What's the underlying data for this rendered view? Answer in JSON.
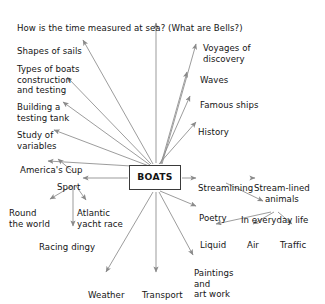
{
  "diagram": {
    "type": "mind-map",
    "title_question": "How is the time measured at sea? (What are Bells?)",
    "center": {
      "id": "boats",
      "label": "BOATS",
      "x": 129,
      "y": 165,
      "w": 52,
      "h": 25
    },
    "colors": {
      "background": "#ffffff",
      "text": "#141414",
      "edge": "#8c8c8c",
      "box_border": "#3a3a3a"
    },
    "nodes": [
      {
        "id": "time-at-sea",
        "label": "How is the time measured at sea? (What are Bells?)",
        "x": 17,
        "y": 13,
        "align": "left"
      },
      {
        "id": "shapes-of-sails",
        "label": "Shapes of sails",
        "x": 17,
        "y": 36,
        "align": "left"
      },
      {
        "id": "types-of-boats",
        "label": "Types of boats\nconstruction\nand testing",
        "x": 17,
        "y": 54,
        "align": "left"
      },
      {
        "id": "building-tank",
        "label": "Building a\ntesting tank",
        "x": 17,
        "y": 92,
        "align": "left"
      },
      {
        "id": "study-of-variables",
        "label": "Study of\nvariables",
        "x": 17,
        "y": 120,
        "align": "left"
      },
      {
        "id": "americas-cup",
        "label": "America's Cup",
        "x": 20,
        "y": 155,
        "align": "left"
      },
      {
        "id": "sport",
        "label": "Sport",
        "x": 57,
        "y": 172,
        "align": "left"
      },
      {
        "id": "round-the-world",
        "label": "Round\nthe world",
        "x": 9,
        "y": 198,
        "align": "left"
      },
      {
        "id": "atlantic-yacht-race",
        "label": "Atlantic\nyacht race",
        "x": 77,
        "y": 198,
        "align": "left"
      },
      {
        "id": "racing-dingy",
        "label": "Racing dingy",
        "x": 39,
        "y": 232,
        "align": "left"
      },
      {
        "id": "weather",
        "label": "Weather",
        "x": 88,
        "y": 280,
        "align": "left"
      },
      {
        "id": "transport",
        "label": "Transport",
        "x": 142,
        "y": 280,
        "align": "left"
      },
      {
        "id": "paintings-art-work",
        "label": "Paintings\nand\nart work",
        "x": 194,
        "y": 258,
        "align": "left"
      },
      {
        "id": "poetry",
        "label": "Poetry",
        "x": 199,
        "y": 203,
        "align": "left"
      },
      {
        "id": "streamlining",
        "label": "Streamlining",
        "x": 198,
        "y": 173,
        "align": "left"
      },
      {
        "id": "stream-lined-animals",
        "label": "Stream-lined\nanimals",
        "x": 256,
        "y": 173,
        "align": "left"
      },
      {
        "id": "in-everyday-life",
        "label": "In everyday life",
        "x": 241,
        "y": 205,
        "align": "left"
      },
      {
        "id": "liquid",
        "label": "Liquid",
        "x": 200,
        "y": 230,
        "align": "left"
      },
      {
        "id": "air",
        "label": "Air",
        "x": 247,
        "y": 230,
        "align": "left"
      },
      {
        "id": "traffic",
        "label": "Traffic",
        "x": 280,
        "y": 230,
        "align": "left"
      },
      {
        "id": "history",
        "label": "History",
        "x": 198,
        "y": 117,
        "align": "left"
      },
      {
        "id": "famous-ships",
        "label": "Famous ships",
        "x": 200,
        "y": 90,
        "align": "left"
      },
      {
        "id": "waves",
        "label": "Waves",
        "x": 200,
        "y": 65,
        "align": "left"
      },
      {
        "id": "voyages-of-discovery",
        "label": "Voyages of\ndiscovery",
        "x": 203,
        "y": 33,
        "align": "left"
      }
    ],
    "edges": [
      {
        "from": "boats",
        "to": "time-at-sea",
        "x1": 156,
        "y1": 163,
        "x2": 156,
        "y2": 23
      },
      {
        "from": "boats",
        "to": "shapes-of-sails",
        "x1": 153,
        "y1": 164,
        "x2": 83,
        "y2": 40
      },
      {
        "from": "boats",
        "to": "types-of-boats",
        "x1": 151,
        "y1": 164,
        "x2": 67,
        "y2": 77
      },
      {
        "from": "boats",
        "to": "building-tank",
        "x1": 150,
        "y1": 165,
        "x2": 63,
        "y2": 102
      },
      {
        "from": "boats",
        "to": "study-of-variables",
        "x1": 149,
        "y1": 166,
        "x2": 54,
        "y2": 130
      },
      {
        "from": "boats",
        "to": "americas-cup-line",
        "x1": 148,
        "y1": 167,
        "x2": 48,
        "y2": 161
      },
      {
        "from": "boats",
        "to": "history",
        "x1": 159,
        "y1": 164,
        "x2": 196,
        "y2": 122
      },
      {
        "from": "boats",
        "to": "famous-ships",
        "x1": 160,
        "y1": 164,
        "x2": 190,
        "y2": 96
      },
      {
        "from": "boats",
        "to": "waves",
        "x1": 161,
        "y1": 164,
        "x2": 187,
        "y2": 72
      },
      {
        "from": "boats",
        "to": "voyages-of-discovery",
        "x1": 162,
        "y1": 164,
        "x2": 196,
        "y2": 44
      },
      {
        "from": "boats",
        "to": "sport",
        "x1": 128,
        "y1": 178,
        "x2": 83,
        "y2": 178
      },
      {
        "from": "sport",
        "to": "americas-cup",
        "x1": 72,
        "y1": 171,
        "x2": 58,
        "y2": 159
      },
      {
        "from": "sport",
        "to": "round-the-world",
        "x1": 72,
        "y1": 186,
        "x2": 50,
        "y2": 199
      },
      {
        "from": "sport",
        "to": "atlantic-yacht-race",
        "x1": 76,
        "y1": 186,
        "x2": 86,
        "y2": 200
      },
      {
        "from": "sport",
        "to": "racing-dingy",
        "x1": 73,
        "y1": 186,
        "x2": 73,
        "y2": 226
      },
      {
        "from": "boats",
        "to": "weather",
        "x1": 153,
        "y1": 192,
        "x2": 106,
        "y2": 272
      },
      {
        "from": "boats",
        "to": "transport",
        "x1": 156,
        "y1": 192,
        "x2": 156,
        "y2": 272
      },
      {
        "from": "boats",
        "to": "paintings-art-work",
        "x1": 159,
        "y1": 192,
        "x2": 193,
        "y2": 255
      },
      {
        "from": "boats",
        "to": "poetry",
        "x1": 160,
        "y1": 191,
        "x2": 196,
        "y2": 206
      },
      {
        "from": "boats",
        "to": "streamlining",
        "x1": 182,
        "y1": 178,
        "x2": 196,
        "y2": 178
      },
      {
        "from": "streamlining",
        "to": "stream-lined-animals",
        "x1": 252,
        "y1": 178,
        "x2": 255,
        "y2": 178
      },
      {
        "from": "streamlining",
        "to": "in-everyday-life",
        "x1": 226,
        "y1": 183,
        "x2": 263,
        "y2": 201
      },
      {
        "from": "in-everyday-life",
        "to": "liquid",
        "x1": 271,
        "y1": 212,
        "x2": 216,
        "y2": 224
      },
      {
        "from": "in-everyday-life",
        "to": "air",
        "x1": 274,
        "y1": 212,
        "x2": 253,
        "y2": 224
      },
      {
        "from": "in-everyday-life",
        "to": "traffic",
        "x1": 278,
        "y1": 212,
        "x2": 292,
        "y2": 224
      }
    ]
  }
}
